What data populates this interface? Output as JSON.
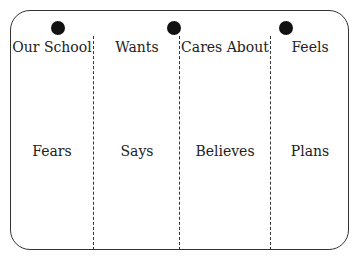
{
  "top_labels": [
    "Our School",
    "Wants",
    "Cares About",
    "Feels"
  ],
  "middle_labels": [
    "Fears",
    "Says",
    "Believes",
    "Plans"
  ],
  "colors": {
    "border": "#333333",
    "dot": "#111111",
    "background": "#ffffff"
  }
}
